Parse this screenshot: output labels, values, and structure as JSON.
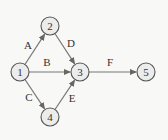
{
  "diagram": {
    "type": "network",
    "background": "#f8f8f6",
    "nodes": [
      {
        "id": "1",
        "label": "1",
        "x": 20,
        "y": 72
      },
      {
        "id": "2",
        "label": "2",
        "x": 50,
        "y": 26
      },
      {
        "id": "3",
        "label": "3",
        "x": 80,
        "y": 72
      },
      {
        "id": "4",
        "label": "4",
        "x": 50,
        "y": 117
      },
      {
        "id": "5",
        "label": "5",
        "x": 146,
        "y": 72
      }
    ],
    "edges": [
      {
        "label": "A",
        "from": "1",
        "to": "2",
        "lx": 28,
        "ly": 49
      },
      {
        "label": "B",
        "from": "1",
        "to": "3",
        "lx": 47,
        "ly": 66
      },
      {
        "label": "C",
        "from": "1",
        "to": "4",
        "lx": 29,
        "ly": 101
      },
      {
        "label": "D",
        "from": "2",
        "to": "3",
        "lx": 71,
        "ly": 47
      },
      {
        "label": "E",
        "from": "4",
        "to": "3",
        "lx": 72,
        "ly": 102
      },
      {
        "label": "F",
        "from": "3",
        "to": "5",
        "lx": 110,
        "ly": 66
      }
    ]
  }
}
